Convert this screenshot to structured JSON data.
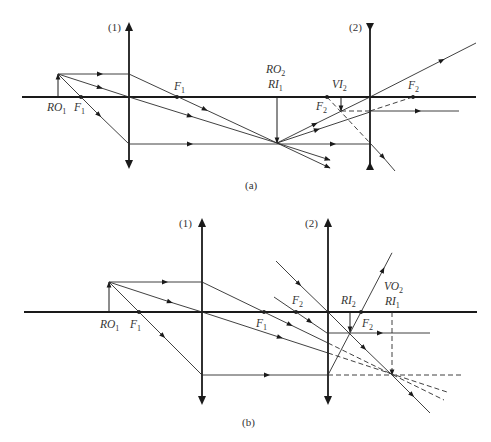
{
  "figure": {
    "panel_a": {
      "caption": "(a)",
      "lens_1_label": "(1)",
      "lens_2_label": "(2)",
      "lens_1_type": "converging",
      "lens_2_type": "diverging",
      "labels": {
        "ro1": {
          "base": "RO",
          "sub": "1"
        },
        "f1_left": {
          "base": "F",
          "sub": "1"
        },
        "f1_right": {
          "base": "F",
          "sub": "1"
        },
        "ro2": {
          "base": "RO",
          "sub": "2"
        },
        "ri1": {
          "base": "RI",
          "sub": "1"
        },
        "vi2": {
          "base": "VI",
          "sub": "2"
        },
        "f2_left": {
          "base": "F",
          "sub": "2"
        },
        "f2_right": {
          "base": "F",
          "sub": "2"
        }
      }
    },
    "panel_b": {
      "caption": "(b)",
      "lens_1_label": "(1)",
      "lens_2_label": "(2)",
      "lens_1_type": "converging",
      "lens_2_type": "converging",
      "labels": {
        "ro1": {
          "base": "RO",
          "sub": "1"
        },
        "f1_left": {
          "base": "F",
          "sub": "1"
        },
        "f1_right": {
          "base": "F",
          "sub": "1"
        },
        "f2_left": {
          "base": "F",
          "sub": "2"
        },
        "ri2": {
          "base": "RI",
          "sub": "2"
        },
        "f2_right": {
          "base": "F",
          "sub": "2"
        },
        "vo2": {
          "base": "VO",
          "sub": "2"
        },
        "ri1": {
          "base": "RI",
          "sub": "1"
        }
      }
    },
    "colors": {
      "line": "#1a1a1a",
      "ray": "#2b2b2b",
      "text": "#333333",
      "background": "#ffffff"
    }
  }
}
